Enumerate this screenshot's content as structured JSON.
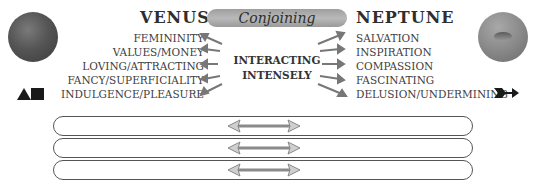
{
  "header": {
    "left_planet": "VENUS",
    "aspect": "Conjoining",
    "right_planet": "NEPTUNE"
  },
  "venus": {
    "keywords": [
      "FEMININITY",
      "VALUES/MONEY",
      "LOVING/ATTRACTING",
      "FANCY/SUPERFICIALITY",
      "INDULGENCE/PLEASURE"
    ],
    "icon": "triangle-square-glyph"
  },
  "neptune": {
    "keywords": [
      "SALVATION",
      "INSPIRATION",
      "COMPASSION",
      "FASCINATING",
      "DELUSION/UNDERMINING"
    ],
    "icon": "arrow-glyph"
  },
  "center": {
    "line1": "INTERACTING",
    "line2": "INTENSELY"
  },
  "bands": [
    {
      "arrow": "double-arrow"
    },
    {
      "arrow": "double-arrow"
    },
    {
      "arrow": "double-arrow"
    }
  ],
  "colors": {
    "pill": "#a9a9a9",
    "text": "#3a3a3a",
    "arrow": "#9a9a9a"
  }
}
